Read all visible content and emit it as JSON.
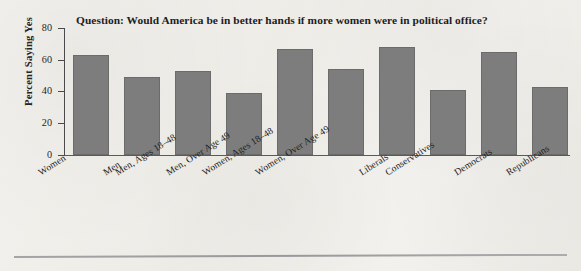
{
  "chart_data": {
    "type": "bar",
    "title": "Question: Would America be in better hands if more women were in political office?",
    "xlabel": "",
    "ylabel": "Percent Saying Yes",
    "ylim": [
      0,
      80
    ],
    "yticks": [
      0,
      20,
      40,
      60,
      80
    ],
    "grid": false,
    "legend": "none",
    "bar_color": "#7d7d7d",
    "categories": [
      "Women",
      "Men",
      "Men, Ages 18–48",
      "Men, Over Age 49",
      "Women, Ages 18–48",
      "Women, Over Age 49",
      "Liberals",
      "Conservatives",
      "Democrats",
      "Republicans"
    ],
    "values": [
      63,
      49,
      53,
      39,
      67,
      54,
      68,
      41,
      65,
      43
    ]
  },
  "figure": {
    "background_color": "#f2f0ec",
    "axis_color": "#4a4a4c",
    "text_color": "#1d1d20"
  }
}
